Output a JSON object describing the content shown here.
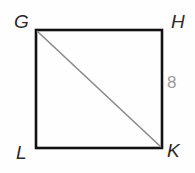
{
  "figure": {
    "canvas": {
      "width": 195,
      "height": 173,
      "background": "#fefefe"
    },
    "shape": {
      "kind": "square",
      "name": "GHKL",
      "stroke_color": "#111111",
      "stroke_width": 2.6,
      "fill": "none",
      "corners": {
        "top_left": {
          "label": "G",
          "x": 36,
          "y": 30
        },
        "top_right": {
          "label": "H",
          "x": 162,
          "y": 30
        },
        "bottom_right": {
          "label": "K",
          "x": 162,
          "y": 148
        },
        "bottom_left": {
          "label": "L",
          "x": 36,
          "y": 148
        }
      }
    },
    "diagonal": {
      "name": "GK",
      "from": "G",
      "to": "K",
      "stroke_color": "#8a8a8a",
      "stroke_width": 1.6
    },
    "vertex_labels": [
      {
        "id": "G",
        "text": "G",
        "color": "#2b2b2b"
      },
      {
        "id": "H",
        "text": "H",
        "color": "#2b2b2b"
      },
      {
        "id": "L",
        "text": "L",
        "color": "#2b2b2b"
      },
      {
        "id": "K",
        "text": "K",
        "color": "#2b2b2b"
      }
    ],
    "measurements": [
      {
        "id": "side-HK",
        "side": "HK",
        "text": "8",
        "color": "#9a9a9a"
      }
    ],
    "artifact": {
      "text": ""
    }
  }
}
